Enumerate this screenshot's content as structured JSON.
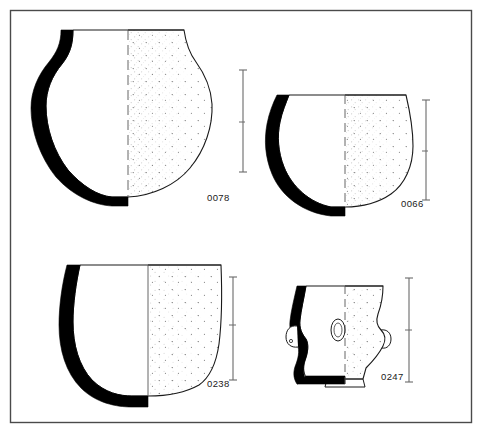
{
  "plate": {
    "title": "Archaeological pottery profile plate",
    "background_color": "#ffffff",
    "ink_color": "#1a1a1a",
    "border": {
      "name": "plate-frame",
      "x": 10,
      "y": 10,
      "width": 462,
      "height": 413,
      "stroke": "#4a4a4a"
    }
  },
  "vessels": [
    {
      "id": "0078",
      "label": "0078",
      "description": "Globular jar with everted flaring neck and rounded body",
      "position": "top-left",
      "section_side": "left",
      "section_fill": "#000000",
      "exterior_side": "right",
      "exterior_texture": "stipple",
      "axis_line": "dashed-vertical",
      "scale_bar": {
        "x": 243,
        "top": 70,
        "bottom": 172,
        "ticks": 3
      }
    },
    {
      "id": "0066",
      "label": "0066",
      "description": "Hemispherical bowl with slightly everted rim and rounded base",
      "position": "top-right",
      "section_side": "left",
      "section_fill": "#000000",
      "exterior_side": "right",
      "exterior_texture": "stipple",
      "axis_line": "dashed-vertical",
      "scale_bar": {
        "x": 426,
        "top": 100,
        "bottom": 200,
        "ticks": 3
      }
    },
    {
      "id": "0238",
      "label": "0238",
      "description": "Deep cup or beaker with flaring rim and rounded base",
      "position": "bottom-left",
      "section_side": "left",
      "section_fill": "#000000",
      "exterior_side": "right",
      "exterior_texture": "stipple",
      "axis_line": "solid-vertical",
      "scale_bar": {
        "x": 233,
        "top": 277,
        "bottom": 380,
        "ticks": 3
      }
    },
    {
      "id": "0247",
      "label": "0247",
      "description": "Small footed cup with lug handles and oval boss on body",
      "position": "bottom-right",
      "section_side": "left",
      "section_fill": "#000000",
      "exterior_side": "right",
      "exterior_texture": "stipple",
      "axis_line": "dashed-vertical",
      "features": [
        "lug-handle-left",
        "lug-handle-right",
        "oval-boss",
        "ring-foot"
      ],
      "scale_bar": {
        "x": 409,
        "top": 278,
        "bottom": 382,
        "ticks": 3
      }
    }
  ]
}
